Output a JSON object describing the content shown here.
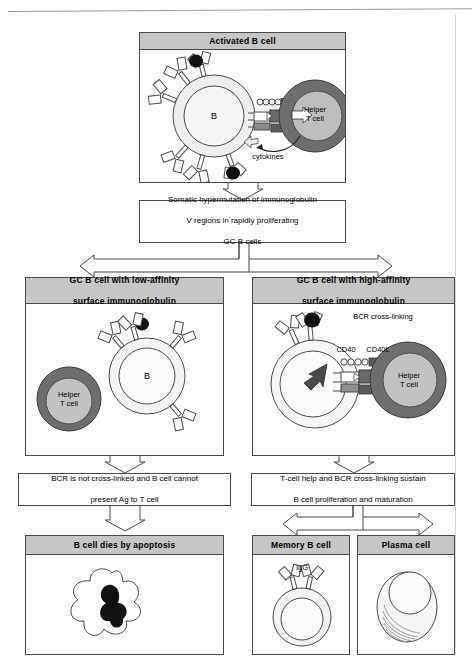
{
  "figure": {
    "colors": {
      "header_fill": "#c6c6c6",
      "border": "#4a4a4a",
      "tcell_ring": "#6e6e6e",
      "tcell_core": "#bdbdbd",
      "bcell_fill": "#f0f0f0",
      "antigen": "#111111"
    }
  },
  "nodes": {
    "activated_b_cell": {
      "header": "Activated  B cell",
      "labels": {
        "b_cell": "B",
        "helper_t_cell_line1": "Helper",
        "helper_t_cell_line2": "T cell",
        "cytokines": "cytokines"
      }
    },
    "somatic_hypermutation": {
      "line1": "Somatic hypermutation of immunoglobulin",
      "line2": "V regions in rapidly proliferating",
      "line3": "GC B cells"
    },
    "low_affinity": {
      "header_line1": "GC B cell with low-affinity",
      "header_line2": "surface immunoglobulin",
      "labels": {
        "b_cell": "B",
        "helper_t_cell_line1": "Helper",
        "helper_t_cell_line2": "T cell"
      }
    },
    "high_affinity": {
      "header_line1": "GC B cell with high-affinity",
      "header_line2": "surface immunoglobulin",
      "labels": {
        "bcr_cross_linking": "BCR cross-linking",
        "cd40": "CD40",
        "cd40l": "CD40L",
        "helper_t_cell_line1": "Helper",
        "helper_t_cell_line2": "T cell"
      }
    },
    "low_outcome": {
      "line1": "BCR is not cross-linked and B cell cannot",
      "line2": "present Ag to T cell"
    },
    "high_outcome": {
      "line1": "T-cell help and BCR cross-linking sustain",
      "line2": "B cell proliferation and maturation"
    },
    "apoptosis": {
      "header": "B cell dies by apoptosis"
    },
    "memory_b_cell": {
      "header": "Memory B cell",
      "labels": {
        "igg": "IgG"
      }
    },
    "plasma_cell": {
      "header": "Plasma cell"
    }
  }
}
